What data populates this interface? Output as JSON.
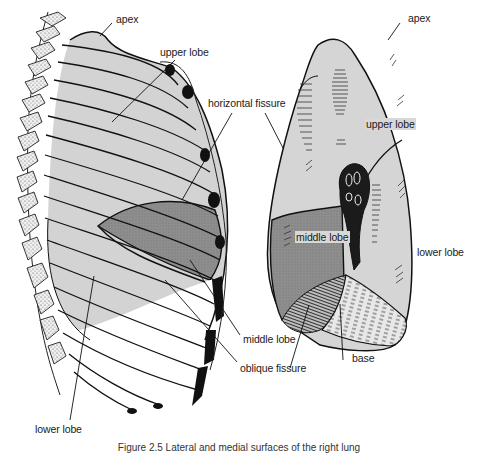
{
  "figure": {
    "caption": "Figure 2.5 Lateral and medial surfaces of the right lung",
    "colors": {
      "lobe_light": "#d3d3d3",
      "lobe_middle": "#8f8f8f",
      "outline": "#111111",
      "background": "#ffffff",
      "hilum": "#1a1a1a"
    }
  },
  "lateral_view": {
    "labels": {
      "apex": "apex",
      "upper_lobe": "upper lobe",
      "horizontal_fissure": "horizontal fissure",
      "middle_lobe": "middle lobe",
      "oblique_fissure": "oblique fissure",
      "lower_lobe": "lower lobe"
    }
  },
  "medial_view": {
    "labels": {
      "apex": "apex",
      "upper_lobe": "upper lobe",
      "middle_lobe": "middle lobe",
      "lower_lobe": "lower lobe",
      "base": "base"
    }
  }
}
